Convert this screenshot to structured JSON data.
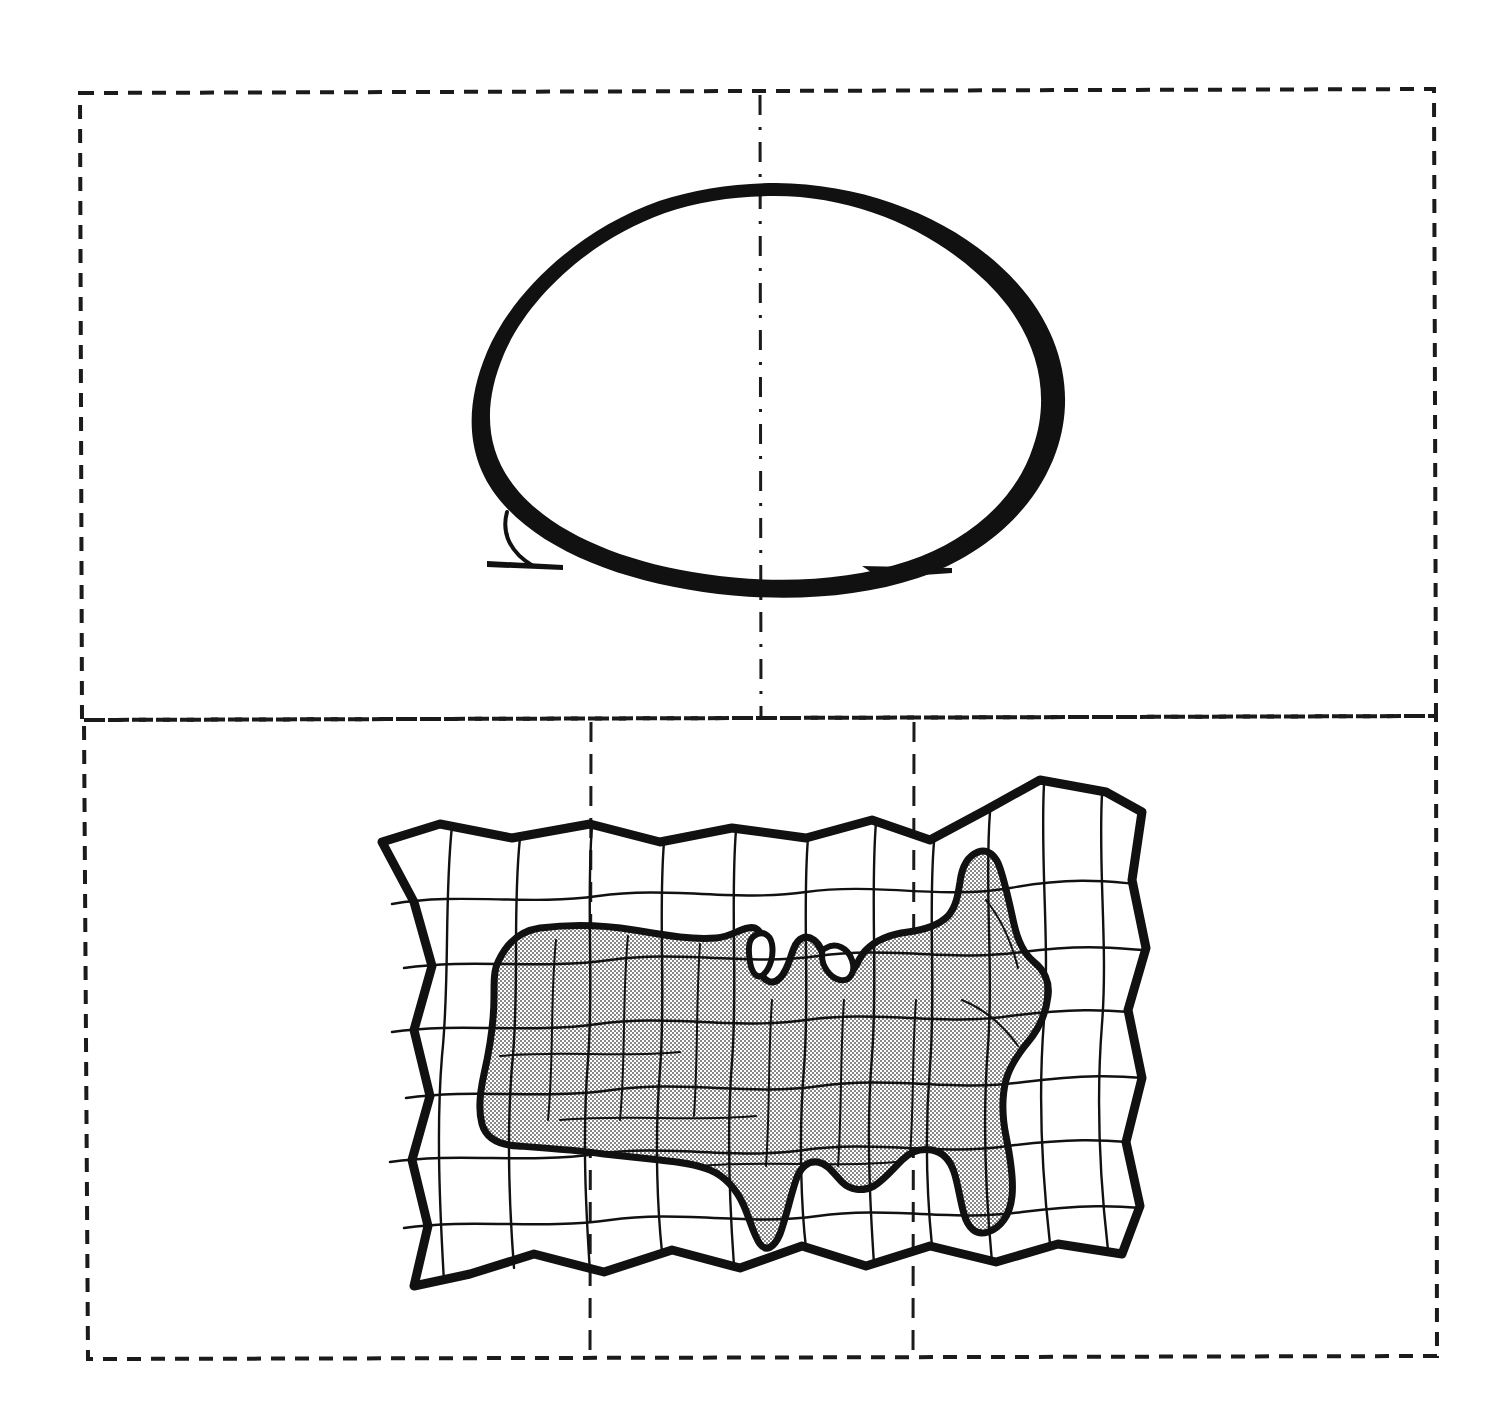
{
  "document": {
    "kind": "line-drawing-figure",
    "title": "",
    "caption": "",
    "background_color": "#ffffff",
    "ink_color": "#111111",
    "shade_color": "#d9d9d9",
    "width": 1504,
    "height": 1424
  },
  "panels": [
    {
      "id": "upper-panel",
      "name": "globe-panel",
      "label": "",
      "frame": {
        "style": "dashed",
        "x": 78,
        "y": 92,
        "width": 1358,
        "height": 626,
        "stroke_color": "#1b1b1b",
        "dash": "14 10",
        "stroke_width": 4
      },
      "center_meridian": {
        "name": "center-meridian-line",
        "label": "",
        "x": 760,
        "y_top": 92,
        "y_bottom": 718,
        "style": "dash-dot",
        "stroke_width": 3
      },
      "figure": {
        "name": "egg-globe-shape",
        "label": "",
        "type": "egg-outline",
        "fill": "none",
        "stroke_color": "#111111",
        "center_x": 758,
        "center_y": 378,
        "radius_x": 277,
        "radius_y": 195,
        "tilt_degrees": -12,
        "baseline_tails": [
          {
            "name": "left-tail",
            "x1": 487,
            "y1": 563,
            "x2": 560,
            "y2": 567
          },
          {
            "name": "right-tail",
            "x1": 868,
            "y1": 572,
            "x2": 952,
            "y2": 570
          }
        ]
      }
    },
    {
      "id": "lower-panel",
      "name": "cartogram-panel",
      "label": "",
      "frame": {
        "style": "dashed",
        "x": 88,
        "y": 718,
        "width": 1348,
        "height": 640,
        "stroke_color": "#1b1b1b",
        "dash": "14 10",
        "stroke_width": 4
      },
      "center_meridians": [
        {
          "name": "left-meridian-line",
          "label": "",
          "x": 590,
          "y_top": 722,
          "y_bottom": 1356,
          "style": "dash-dot",
          "stroke_width": 3
        },
        {
          "name": "right-meridian-line",
          "label": "",
          "x": 914,
          "y_top": 722,
          "y_bottom": 1356,
          "style": "dash-dot",
          "stroke_width": 3
        }
      ],
      "figure": {
        "name": "distorted-grid-us-map",
        "label": "",
        "type": "rubber-sheet-cartogram",
        "bounds": {
          "x": 380,
          "y": 780,
          "width": 770,
          "height": 510
        },
        "outer_border_stroke": 9,
        "graticule_stroke": 2.2,
        "shaded_region": {
          "name": "united-states-shaded-area",
          "label": "",
          "fill_pattern": "stipple-dots",
          "fill_color": "#d9d9d9",
          "outline_stroke": 7
        },
        "grid": {
          "columns": 8,
          "rows": 6,
          "wavy": true
        }
      }
    }
  ],
  "legend": {
    "present": false,
    "entries": []
  },
  "annotations": []
}
